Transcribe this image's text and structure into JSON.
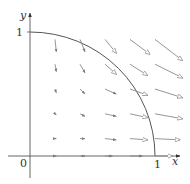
{
  "diagram": {
    "title": "",
    "type": "vector-field",
    "axes": {
      "x_label": "x",
      "y_label": "y",
      "origin_label": "0",
      "x_tick_label": "1",
      "y_tick_label": "1"
    },
    "colors": {
      "axis": "#555555",
      "curve": "#555555",
      "arrow": "#8a8a8a",
      "text": "#333333"
    },
    "curve": {
      "name": "quarter circle",
      "center": [
        0,
        0
      ],
      "radius": 1,
      "from": [
        0,
        1
      ],
      "to": [
        1,
        0
      ]
    },
    "field_arrows": [
      {
        "x": 0.2,
        "y": 0.94,
        "dx": 0.01,
        "dy": -0.1
      },
      {
        "x": 0.4,
        "y": 0.94,
        "dx": 0.04,
        "dy": -0.1
      },
      {
        "x": 0.6,
        "y": 0.94,
        "dx": 0.09,
        "dy": -0.11
      },
      {
        "x": 0.8,
        "y": 0.94,
        "dx": 0.16,
        "dy": -0.12
      },
      {
        "x": 1.0,
        "y": 0.94,
        "dx": 0.22,
        "dy": -0.17
      },
      {
        "x": 0.2,
        "y": 0.74,
        "dx": 0.01,
        "dy": -0.06
      },
      {
        "x": 0.4,
        "y": 0.74,
        "dx": 0.04,
        "dy": -0.07
      },
      {
        "x": 0.6,
        "y": 0.74,
        "dx": 0.09,
        "dy": -0.08
      },
      {
        "x": 0.8,
        "y": 0.74,
        "dx": 0.14,
        "dy": -0.09
      },
      {
        "x": 1.0,
        "y": 0.74,
        "dx": 0.22,
        "dy": -0.11
      },
      {
        "x": 0.2,
        "y": 0.54,
        "dx": 0.01,
        "dy": -0.03
      },
      {
        "x": 0.4,
        "y": 0.54,
        "dx": 0.04,
        "dy": -0.04
      },
      {
        "x": 0.6,
        "y": 0.54,
        "dx": 0.09,
        "dy": -0.04
      },
      {
        "x": 0.8,
        "y": 0.54,
        "dx": 0.14,
        "dy": -0.05
      },
      {
        "x": 1.0,
        "y": 0.54,
        "dx": 0.22,
        "dy": -0.07
      },
      {
        "x": 0.2,
        "y": 0.34,
        "dx": 0.01,
        "dy": -0.01
      },
      {
        "x": 0.4,
        "y": 0.34,
        "dx": 0.04,
        "dy": -0.02
      },
      {
        "x": 0.6,
        "y": 0.34,
        "dx": 0.09,
        "dy": -0.02
      },
      {
        "x": 0.8,
        "y": 0.34,
        "dx": 0.14,
        "dy": -0.03
      },
      {
        "x": 1.0,
        "y": 0.34,
        "dx": 0.22,
        "dy": -0.04
      },
      {
        "x": 0.2,
        "y": 0.14,
        "dx": 0.01,
        "dy": 0.0
      },
      {
        "x": 0.4,
        "y": 0.14,
        "dx": 0.04,
        "dy": 0.0
      },
      {
        "x": 0.6,
        "y": 0.14,
        "dx": 0.09,
        "dy": -0.01
      },
      {
        "x": 0.8,
        "y": 0.14,
        "dx": 0.14,
        "dy": -0.01
      },
      {
        "x": 1.0,
        "y": 0.14,
        "dx": 0.2,
        "dy": -0.01
      },
      {
        "x": 0.2,
        "y": 0.0,
        "dx": 0.01,
        "dy": 0.0
      },
      {
        "x": 0.4,
        "y": 0.0,
        "dx": 0.04,
        "dy": 0.0
      },
      {
        "x": 0.6,
        "y": 0.0,
        "dx": 0.06,
        "dy": 0.0
      },
      {
        "x": 0.8,
        "y": 0.0,
        "dx": 0.1,
        "dy": 0.0
      },
      {
        "x": 1.0,
        "y": 0.0,
        "dx": 0.14,
        "dy": 0.0
      }
    ]
  }
}
